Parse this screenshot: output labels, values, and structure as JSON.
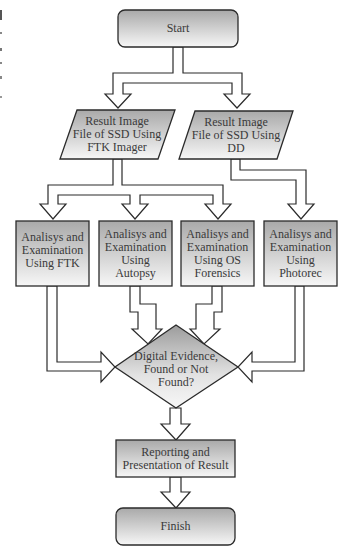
{
  "diagram": {
    "type": "flowchart",
    "colors": {
      "stroke": "#2b2b2b",
      "fill_top": "#a9a9a9",
      "fill_bottom": "#f7f7f7",
      "text": "#3a3a3a",
      "background": "#ffffff"
    },
    "nodes": {
      "start": {
        "shape": "rounded-rect",
        "label": "Start"
      },
      "image_ftk": {
        "shape": "parallelogram",
        "label": "Result Image\nFile of SSD Using\nFTK Imager"
      },
      "image_dd": {
        "shape": "parallelogram",
        "label": "Result Image\nFile of SSD Using\nDD"
      },
      "analysis_ftk": {
        "shape": "rect",
        "label": "Analisys and\nExamination\nUsing FTK"
      },
      "analysis_autopsy": {
        "shape": "rect",
        "label": "Analisys and\nExamination\nUsing\nAutopsy"
      },
      "analysis_osf": {
        "shape": "rect",
        "label": "Analisys and\nExamination\nUsing OS\nForensics"
      },
      "analysis_photorec": {
        "shape": "rect",
        "label": "Analisys and\nExamination\nUsing\nPhotorec"
      },
      "decision": {
        "shape": "diamond",
        "label": "Digital Evidence,\nFound or Not\nFound?"
      },
      "reporting": {
        "shape": "rect",
        "label": "Reporting and\nPresentation of Result"
      },
      "finish": {
        "shape": "rounded-rect",
        "label": "Finish"
      }
    },
    "edges": [
      {
        "from": "start",
        "to": "image_ftk"
      },
      {
        "from": "start",
        "to": "image_dd"
      },
      {
        "from": "image_ftk",
        "to": "analysis_ftk"
      },
      {
        "from": "image_ftk",
        "to": "analysis_autopsy"
      },
      {
        "from": "image_ftk",
        "to": "analysis_osf"
      },
      {
        "from": "image_dd",
        "to": "analysis_photorec"
      },
      {
        "from": "analysis_ftk",
        "to": "decision"
      },
      {
        "from": "analysis_autopsy",
        "to": "decision"
      },
      {
        "from": "analysis_osf",
        "to": "decision"
      },
      {
        "from": "analysis_photorec",
        "to": "decision"
      },
      {
        "from": "decision",
        "to": "reporting"
      },
      {
        "from": "reporting",
        "to": "finish"
      }
    ]
  }
}
